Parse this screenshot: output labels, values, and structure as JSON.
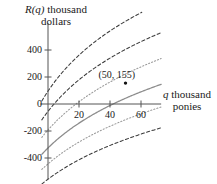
{
  "chart_data": {
    "type": "line",
    "title": "",
    "ylabel_line1": "R(q) thousand",
    "ylabel_line2": "dollars",
    "ylabel_var": "R(q)",
    "ylabel_rest": " thousand",
    "xlabel_var": "q",
    "xlabel_rest": " thousand",
    "xlabel_line2": "ponies",
    "xlabel_full": "q thousand ponies",
    "ylabel_full": "R(q) thousand dollars",
    "xlim": [
      -5,
      73
    ],
    "ylim": [
      -560,
      600
    ],
    "xticks": [
      20,
      40,
      60
    ],
    "xtick_labels": [
      "20",
      "40",
      "60"
    ],
    "yticks": [
      -400,
      -200,
      0,
      200,
      400
    ],
    "ytick_labels": [
      "-400",
      "-200",
      "0",
      "200",
      "400"
    ],
    "grid": false,
    "legend": "none",
    "annotations": [
      {
        "text": "(50, 155)",
        "x": 50,
        "y": 155,
        "marker": true
      }
    ],
    "series": [
      {
        "name": "curve-1-upper-dashed",
        "style": "dashed",
        "color": "#3b3b3b",
        "a": 230,
        "b": 0.055,
        "c": -220
      },
      {
        "name": "curve-2-dashed",
        "style": "dashed",
        "color": "#3b3b3b",
        "a": 215,
        "b": 0.048,
        "c": -320
      },
      {
        "name": "curve-3-dotted",
        "style": "dotted",
        "color": "#9a9a9a",
        "a": 205,
        "b": 0.042,
        "c": -420
      },
      {
        "name": "curve-4-solid",
        "style": "solid",
        "color": "#8c8c8c",
        "a": 190,
        "b": 0.038,
        "c": -520
      },
      {
        "name": "curve-5-dotted",
        "style": "dotted",
        "color": "#9a9a9a",
        "a": 178,
        "b": 0.034,
        "c": -610
      },
      {
        "name": "curve-6-lower-dashed",
        "style": "dashed",
        "color": "#3b3b3b",
        "a": 170,
        "b": 0.03,
        "c": -700
      }
    ],
    "colors": {
      "axis": "#555555",
      "dashed_curve": "#3b3b3b",
      "dotted_curve": "#9a9a9a",
      "solid_curve": "#8c8c8c",
      "marker": "#111111",
      "background": "#ffffff",
      "text": "#1a1a1a"
    }
  }
}
